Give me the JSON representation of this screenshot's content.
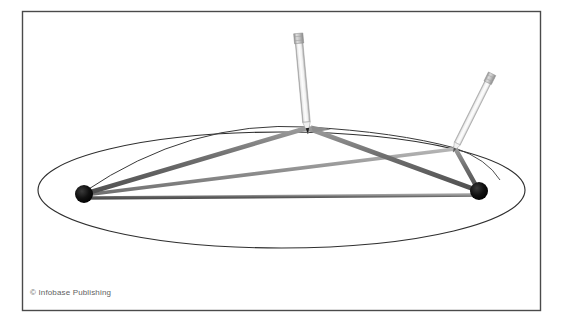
{
  "figure": {
    "credit": "© Infobase Publishing",
    "background_color": "#ffffff",
    "border": {
      "name": "figure-border",
      "color": "#4a4a4a",
      "x": 22,
      "y": 11,
      "width": 518,
      "height": 299,
      "stroke_width": 1.4
    },
    "ellipse": {
      "name": "ellipse-outline",
      "cx": 281.5,
      "cy": 190,
      "rx": 243.5,
      "ry": 58,
      "stroke": "#2f2f2f",
      "stroke_width": 1.1,
      "fill": "none"
    },
    "foci": [
      {
        "label": "left-focus-tack",
        "cx": 84,
        "cy": 194,
        "r": 9,
        "color": "#0d0d0d"
      },
      {
        "label": "right-focus-tack",
        "cx": 479,
        "cy": 191,
        "r": 9,
        "color": "#0d0d0d"
      }
    ],
    "strings": [
      {
        "label": "string-left-focus-to-pencil-a",
        "x1": 84,
        "y1": 194,
        "x2": 307,
        "y2": 128,
        "color": "#6b6b6b",
        "width": 4.4
      },
      {
        "label": "string-right-focus-to-pencil-a",
        "x1": 479,
        "y1": 191,
        "x2": 307,
        "y2": 128,
        "color": "#6b6b6b",
        "width": 4.4
      },
      {
        "label": "string-left-focus-to-pencil-b",
        "x1": 84,
        "y1": 194,
        "x2": 455,
        "y2": 148,
        "color": "#8a8a8a",
        "width": 3.6
      },
      {
        "label": "string-right-focus-to-pencil-b",
        "x1": 479,
        "y1": 191,
        "x2": 455,
        "y2": 148,
        "color": "#6b6b6b",
        "width": 4.4
      },
      {
        "label": "string-between-foci",
        "x1": 84,
        "y1": 198,
        "x2": 479,
        "y2": 195,
        "color": "#767676",
        "width": 3.4
      }
    ],
    "pencils": [
      {
        "label": "pencil-upright",
        "tip_x": 307,
        "tip_y": 128,
        "top_x": 316,
        "top_y": 33,
        "body_color": "#f3f3f3",
        "edge_color": "#9a9a9a",
        "ferrule_color": "#c9c9c9",
        "tip_color": "#1a1a1a",
        "width": 7
      },
      {
        "label": "pencil-tilted",
        "tip_x": 455,
        "tip_y": 148,
        "top_x": 497,
        "top_y": 64,
        "body_color": "#f5f5f5",
        "edge_color": "#a5a5a5",
        "ferrule_color": "#cccccc",
        "tip_color": "#4a4a4a",
        "width": 6
      }
    ],
    "arc_marks": [
      {
        "label": "pencil-path-arc-left",
        "d": "M 84 192 Q 190 120 307 127",
        "color": "#3a3a3a",
        "width": 1.0
      },
      {
        "label": "pencil-path-arc-right",
        "d": "M 307 127 Q 395 132 455 148",
        "color": "#3a3a3a",
        "width": 1.0
      },
      {
        "label": "pencil-path-arc-far-right",
        "d": "M 455 148 Q 487 160 500 180",
        "color": "#3a3a3a",
        "width": 0.9
      }
    ],
    "pointer_marks": [
      {
        "label": "arrow-mark-pencil-a",
        "d": "M 312 126 L 330 129 L 314 132 Z",
        "color": "#707070"
      }
    ]
  }
}
